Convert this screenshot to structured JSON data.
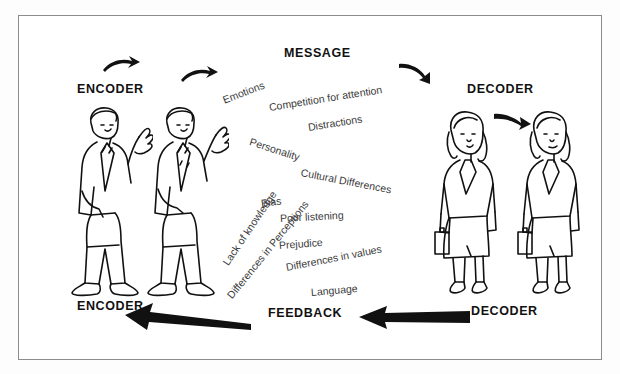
{
  "diagram": {
    "title_label": "MESSAGE",
    "headers": [
      {
        "name": "encoder-top",
        "label": "ENCODER",
        "x": 76,
        "y": 81
      },
      {
        "name": "decoder-top",
        "label": "DECODER",
        "x": 466,
        "y": 81
      },
      {
        "name": "encoder-bottom",
        "label": "ENCODER",
        "x": 76,
        "y": 298
      },
      {
        "name": "feedback",
        "label": "FEEDBACK",
        "x": 267,
        "y": 305
      },
      {
        "name": "decoder-bottom",
        "label": "DECODER",
        "x": 470,
        "y": 303
      }
    ],
    "message": {
      "label": "MESSAGE",
      "x": 283,
      "y": 45
    },
    "barriers": [
      {
        "label": "Emotions",
        "x": 222,
        "y": 93,
        "rot": -21
      },
      {
        "label": "Competition for attention",
        "x": 268,
        "y": 100,
        "rot": -9
      },
      {
        "label": "Distractions",
        "x": 307,
        "y": 120,
        "rot": -9
      },
      {
        "label": "Personality",
        "x": 249,
        "y": 134,
        "rot": 18
      },
      {
        "label": "Cultural Differences",
        "x": 300,
        "y": 165,
        "rot": 11
      },
      {
        "label": "Lack of knowledge",
        "x": 224,
        "y": 257,
        "rot": -56
      },
      {
        "label": "Bias",
        "x": 260,
        "y": 196,
        "rot": -7
      },
      {
        "label": "Poor listening",
        "x": 279,
        "y": 211,
        "rot": -3
      },
      {
        "label": "Differences in Perceptions",
        "x": 228,
        "y": 290,
        "rot": -51
      },
      {
        "label": "Prejudice",
        "x": 278,
        "y": 238,
        "rot": -4
      },
      {
        "label": "Differences in values",
        "x": 285,
        "y": 260,
        "rot": -11
      },
      {
        "label": "Language",
        "x": 310,
        "y": 285,
        "rot": -5
      }
    ],
    "icons": [
      {
        "name": "curved-arrow-encoder-1",
        "x": 104,
        "y": 58
      },
      {
        "name": "curved-arrow-encoder-2",
        "x": 182,
        "y": 68
      },
      {
        "name": "curved-arrow-decoder-1",
        "x": 400,
        "y": 64
      },
      {
        "name": "curved-arrow-decoder-2",
        "x": 495,
        "y": 113
      },
      {
        "name": "feedback-arrow-left",
        "x": 130,
        "y": 305
      },
      {
        "name": "feedback-arrow-right",
        "x": 360,
        "y": 305
      }
    ],
    "figures": [
      {
        "name": "encoder-person-1",
        "type": "man",
        "x": 60,
        "y": 100
      },
      {
        "name": "encoder-person-2",
        "type": "man",
        "x": 133,
        "y": 100
      },
      {
        "name": "decoder-person-1",
        "type": "woman",
        "x": 427,
        "y": 108
      },
      {
        "name": "decoder-person-2",
        "type": "woman",
        "x": 510,
        "y": 108
      }
    ],
    "colors": {
      "ink": "#111111",
      "barrier_text": "#3a3a3a",
      "border": "#8c8c8c",
      "background": "#ffffff"
    }
  }
}
